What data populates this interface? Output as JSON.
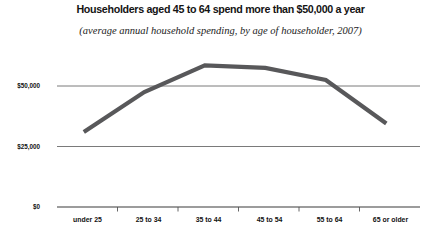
{
  "chart_data": {
    "type": "line",
    "title": "Householders aged 45 to 64 spend more than $50,000 a year",
    "subtitle": "(average annual household spending, by age of householder, 2007)",
    "xlabel": "",
    "ylabel": "",
    "categories": [
      "under 25",
      "25 to 34",
      "35 to 44",
      "45 to 54",
      "55 to 64",
      "65 or older"
    ],
    "values": [
      31000,
      47500,
      58500,
      57500,
      52500,
      34500
    ],
    "series": [
      {
        "name": "average annual household spending",
        "values": [
          31000,
          47500,
          58500,
          57500,
          52500,
          34500
        ]
      }
    ],
    "ylim": [
      0,
      75000
    ],
    "ytick_values": [
      0,
      25000,
      50000
    ],
    "ytick_labels": [
      "$0",
      "$25,000",
      "$50,000"
    ],
    "grid": true,
    "legend": false,
    "line_color": "#58585a",
    "grid_color": "#555555",
    "axis_color": "#333333"
  }
}
